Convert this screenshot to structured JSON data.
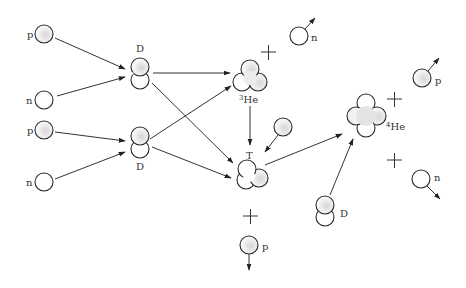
{
  "diagram": {
    "colors": {
      "stroke": "#2a2a2a",
      "fill_light": "#ffffff",
      "fill_shade": "#d8d8d8",
      "background": "#ffffff"
    },
    "particles": [
      {
        "id": "p1",
        "label": "p",
        "kind": "proton"
      },
      {
        "id": "n1",
        "label": "n",
        "kind": "neutron"
      },
      {
        "id": "p2",
        "label": "p",
        "kind": "proton"
      },
      {
        "id": "n2",
        "label": "n",
        "kind": "neutron"
      },
      {
        "id": "D1",
        "label": "D",
        "kind": "deuterium"
      },
      {
        "id": "D2",
        "label": "D",
        "kind": "deuterium"
      },
      {
        "id": "He3",
        "label_sup": "3",
        "label": "He",
        "kind": "helium-3"
      },
      {
        "id": "T",
        "label": "T",
        "kind": "tritium"
      },
      {
        "id": "n_out1",
        "label": "n",
        "kind": "neutron"
      },
      {
        "id": "p_in",
        "label": "",
        "kind": "proton"
      },
      {
        "id": "He4",
        "label_sup": "4",
        "label": "He",
        "kind": "helium-4"
      },
      {
        "id": "p_out1",
        "label": "p",
        "kind": "proton"
      },
      {
        "id": "n_out2",
        "label": "n",
        "kind": "neutron"
      },
      {
        "id": "D3",
        "label": "D",
        "kind": "deuterium"
      },
      {
        "id": "p_out2",
        "label": "p",
        "kind": "proton"
      }
    ],
    "plus_signs": [
      "He3-n",
      "He4-p",
      "He4-n",
      "T-p"
    ],
    "edges": [
      {
        "from": "p1",
        "to": "D1"
      },
      {
        "from": "n1",
        "to": "D1"
      },
      {
        "from": "p2",
        "to": "D2"
      },
      {
        "from": "n2",
        "to": "D2"
      },
      {
        "from": "D1",
        "to": "He3"
      },
      {
        "from": "D1",
        "to": "T"
      },
      {
        "from": "D2",
        "to": "He3"
      },
      {
        "from": "D2",
        "to": "T"
      },
      {
        "from": "He3",
        "to": "T"
      },
      {
        "from": "p_in",
        "to": "T"
      },
      {
        "from": "T",
        "to": "He4"
      },
      {
        "from": "D3",
        "to": "He4"
      }
    ]
  }
}
